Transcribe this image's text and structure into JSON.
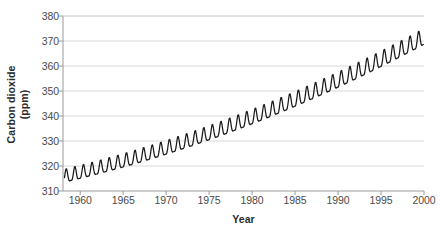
{
  "chart_data": {
    "type": "line",
    "title": "",
    "xlabel": "Year",
    "ylabel": "Carbon dioxide (ppm)",
    "ylabel_lines": [
      "Carbon dioxide",
      "(ppm)"
    ],
    "xlim": [
      1958.0,
      2000.0
    ],
    "ylim": [
      310,
      380
    ],
    "grid": true,
    "grid_axis": "y",
    "legend": "none",
    "series_name": "Atmospheric CO2 (Mauna Loa monthly mean)",
    "line_color": "#1a1a1a",
    "grid_color": "#d8d8d8",
    "axis_color": "#9a9a9a",
    "x_ticks": [
      1960,
      1965,
      1970,
      1975,
      1980,
      1985,
      1990,
      1995,
      2000
    ],
    "x_tick_labels": [
      "1960",
      "1965",
      "1970",
      "1975",
      "1980",
      "1985",
      "1990",
      "1995",
      "2000"
    ],
    "y_ticks": [
      310,
      320,
      330,
      340,
      350,
      360,
      370,
      380
    ],
    "y_tick_labels": [
      "310",
      "320",
      "330",
      "340",
      "350",
      "360",
      "370",
      "380"
    ],
    "x_start": 1958.17,
    "x_end": 1999.92,
    "samples_per_year": 12,
    "trend": {
      "description": "quadratic long-term trend fit, ppm",
      "c0": 315.3,
      "c1": 0.8,
      "c2": 0.0125,
      "t0": 1958.0
    },
    "seasonal": {
      "description": "annual cycle, peak in May, trough in Sept-Oct",
      "amplitude_start_ppm": 2.6,
      "amplitude_end_ppm": 3.2,
      "peak_month_fraction": 0.38,
      "harmonic2_ratio": 0.32
    },
    "annotations": [],
    "reference_points": [
      {
        "year": 1958.2,
        "value": 315.7
      },
      {
        "year": 1960.0,
        "value": 316.9
      },
      {
        "year": 1965.0,
        "value": 320.0
      },
      {
        "year": 1970.0,
        "value": 325.7
      },
      {
        "year": 1975.0,
        "value": 331.1
      },
      {
        "year": 1980.0,
        "value": 338.7
      },
      {
        "year": 1985.0,
        "value": 346.0
      },
      {
        "year": 1990.0,
        "value": 354.4
      },
      {
        "year": 1995.0,
        "value": 360.8
      },
      {
        "year": 1999.9,
        "value": 368.4
      }
    ]
  }
}
